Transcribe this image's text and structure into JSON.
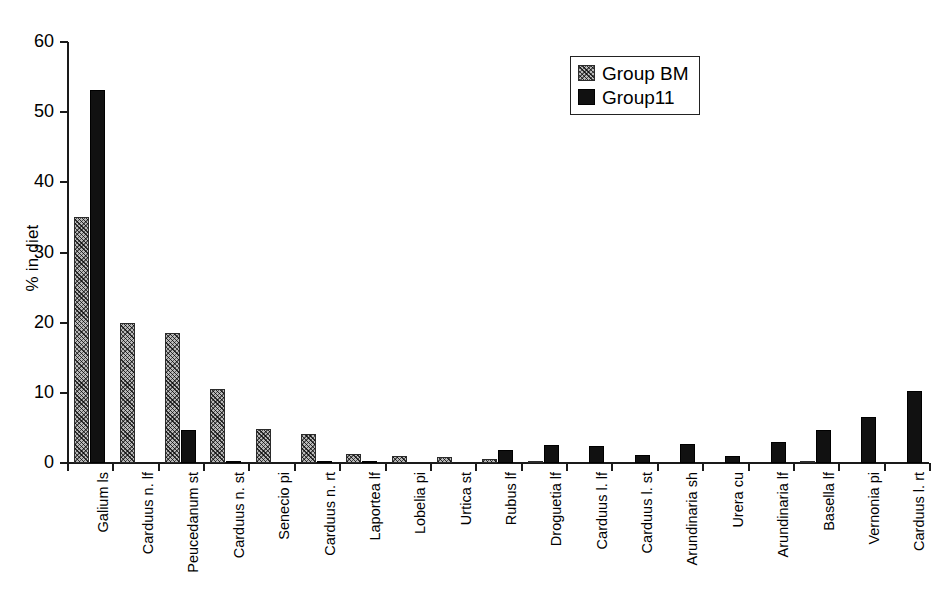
{
  "chart_data": {
    "type": "bar",
    "title": "",
    "xlabel": "",
    "ylabel": "% in diet",
    "ylim": [
      0,
      60
    ],
    "yticks": [
      0,
      10,
      20,
      30,
      40,
      50,
      60
    ],
    "grid": false,
    "legend_position": "top-right",
    "categories": [
      "Galium ls",
      "Carduus n. lf",
      "Peucedanum st",
      "Carduus n. st",
      "Senecio pi",
      "Carduus n. rt",
      "Laportea lf",
      "Lobelia pi",
      "Urtica st",
      "Rubus lf",
      "Droguetia lf",
      "Carduus l. lf",
      "Carduus l. st",
      "Arundinaria sh",
      "Urera cu",
      "Arundinaria lf",
      "Basella lf",
      "Vernonia pi",
      "Carduus l. rt"
    ],
    "series": [
      {
        "name": "Group BM",
        "values": [
          35.0,
          19.9,
          18.5,
          10.5,
          4.9,
          4.2,
          1.3,
          1.0,
          0.9,
          0.6,
          0.3,
          0.0,
          0.0,
          0.0,
          0.0,
          0.0,
          0.2,
          0.0,
          0.0
        ]
      },
      {
        "name": "Group11",
        "values": [
          53.2,
          0.0,
          4.7,
          0.2,
          0.0,
          0.1,
          0.3,
          0.0,
          0.0,
          1.8,
          2.6,
          2.4,
          1.2,
          2.7,
          1.0,
          3.0,
          4.7,
          6.5,
          10.2
        ]
      }
    ]
  },
  "legend": {
    "items": [
      {
        "label": "Group BM",
        "swatch": "hatched-swatch"
      },
      {
        "label": "Group11",
        "swatch": "solid-black-swatch"
      }
    ]
  },
  "colors": {
    "series_bm_fill": "#b9b9b9",
    "series_11_fill": "#111111",
    "axis": "#1a1a1a",
    "background": "#ffffff"
  }
}
